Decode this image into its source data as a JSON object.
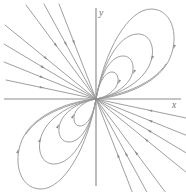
{
  "figure": {
    "kind": "phase-portrait",
    "title": "",
    "background_color": "#ffffff",
    "width": 186,
    "height": 192
  },
  "axes": {
    "origin": {
      "x": 96,
      "y": 99
    },
    "x_axis": {
      "x1": 4,
      "y1": 99,
      "x2": 181,
      "y2": 99
    },
    "y_axis": {
      "x1": 96,
      "y1": 8,
      "x2": 96,
      "y2": 186
    },
    "color": "#8c8c8c",
    "x_label": "x",
    "y_label": "y",
    "x_label_pos": {
      "x": 172,
      "y": 108
    },
    "y_label_pos": {
      "x": 99,
      "y": 16
    }
  },
  "chart_data": {
    "type": "line",
    "title": "",
    "xlabel": "x",
    "ylabel": "y",
    "grid": false,
    "legend": null,
    "curve_color": "#9a9a9a",
    "arrow_color": "#8f8f8f",
    "series": [
      {
        "name": "ray-q2-1",
        "kind": "ray",
        "quadrant": "II",
        "path": "M 6 80 L 96 99",
        "arrows": [
          {
            "x": 42,
            "y": 87.6,
            "angle": 11.9
          }
        ]
      },
      {
        "name": "ray-q2-2",
        "kind": "ray",
        "quadrant": "II",
        "path": "M 4 62 L 96 99",
        "arrows": [
          {
            "x": 42,
            "y": 77.3,
            "angle": 21.9
          }
        ]
      },
      {
        "name": "ray-q2-3",
        "kind": "ray",
        "quadrant": "II",
        "path": "M 4 44 L 96 99",
        "arrows": [
          {
            "x": 43,
            "y": 67.3,
            "angle": 30.9
          }
        ]
      },
      {
        "name": "ray-q2-4",
        "kind": "ray",
        "quadrant": "II",
        "path": "M 5 25 L 96 99",
        "arrows": [
          {
            "x": 46,
            "y": 58.3,
            "angle": 39.1
          }
        ]
      },
      {
        "name": "ray-q2-5",
        "kind": "ray",
        "quadrant": "II",
        "path": "M 26 5 L 96 99",
        "arrows": [
          {
            "x": 56,
            "y": 45.3,
            "angle": 53.3
          }
        ]
      },
      {
        "name": "ray-q2-6",
        "kind": "ray",
        "quadrant": "II",
        "path": "M 44 4 L 96 99",
        "arrows": [
          {
            "x": 66,
            "y": 44.2,
            "angle": 61.3
          }
        ]
      },
      {
        "name": "ray-q2-7",
        "kind": "ray",
        "quadrant": "II",
        "path": "M 59 4 L 96 99",
        "arrows": [
          {
            "x": 74,
            "y": 42.5,
            "angle": 68.7
          }
        ]
      },
      {
        "name": "ray-q4-1",
        "kind": "ray",
        "quadrant": "IV",
        "path": "M 186 118 L 96 99",
        "arrows": [
          {
            "x": 150,
            "y": 110.4,
            "angle": 191.9
          }
        ]
      },
      {
        "name": "ray-q4-2",
        "kind": "ray",
        "quadrant": "IV",
        "path": "M 188 136 L 96 99",
        "arrows": [
          {
            "x": 150,
            "y": 120.7,
            "angle": 201.9
          }
        ]
      },
      {
        "name": "ray-q4-3",
        "kind": "ray",
        "quadrant": "IV",
        "path": "M 188 154 L 96 99",
        "arrows": [
          {
            "x": 149,
            "y": 130.7,
            "angle": 210.9
          }
        ]
      },
      {
        "name": "ray-q4-4",
        "kind": "ray",
        "quadrant": "IV",
        "path": "M 187 173 L 96 99",
        "arrows": [
          {
            "x": 146,
            "y": 139.7,
            "angle": 219.1
          }
        ]
      },
      {
        "name": "ray-q4-5",
        "kind": "ray",
        "quadrant": "IV",
        "path": "M 166 193 L 96 99",
        "arrows": [
          {
            "x": 136,
            "y": 152.7,
            "angle": 233.3
          }
        ]
      },
      {
        "name": "ray-q4-6",
        "kind": "ray",
        "quadrant": "IV",
        "path": "M 148 194 L 96 99",
        "arrows": [
          {
            "x": 126,
            "y": 153.8,
            "angle": 241.3
          }
        ]
      },
      {
        "name": "ray-q4-7",
        "kind": "ray",
        "quadrant": "IV",
        "path": "M 133 194 L 96 99",
        "arrows": [
          {
            "x": 118,
            "y": 155.5,
            "angle": 248.7
          }
        ]
      },
      {
        "name": "loop-q1-outer",
        "kind": "loop",
        "quadrant": "I",
        "path": "M 96 99 C 104 52 128 8 152 9 C 174 10 180 40 168 62 C 156 84 122 97 96 99 Z",
        "arrows": [
          {
            "x": 174,
            "y": 47,
            "angle": 110
          }
        ]
      },
      {
        "name": "loop-q1-mid",
        "kind": "loop",
        "quadrant": "I",
        "path": "M 96 99 C 102 66 118 35 137 34 C 152 33 157 52 148 68 C 139 84 116 96 96 99 Z",
        "arrows": [
          {
            "x": 152,
            "y": 58,
            "angle": 116
          }
        ]
      },
      {
        "name": "loop-q1-inner",
        "kind": "loop",
        "quadrant": "I",
        "path": "M 96 99 C 100 76 110 56 123 56 C 133 56 136 68 130 79 C 124 89 110 97 96 99 Z",
        "arrows": [
          {
            "x": 134,
            "y": 72,
            "angle": 116
          }
        ]
      },
      {
        "name": "loop-q1-tiny",
        "kind": "loop",
        "quadrant": "I",
        "path": "M 96 99 C 98 85 104 72 112 72 C 118 72 120 80 116 87 C 112 93 104 98 96 99 Z",
        "arrows": [
          {
            "x": 119,
            "y": 82,
            "angle": 118
          }
        ]
      },
      {
        "name": "loop-q3-outer",
        "kind": "loop",
        "quadrant": "III",
        "path": "M 96 99 C 88 146 64 190 40 189 C 18 188 12 158 24 136 C 36 114 70 101 96 99 Z",
        "arrows": [
          {
            "x": 18,
            "y": 151,
            "angle": 290
          }
        ]
      },
      {
        "name": "loop-q3-mid",
        "kind": "loop",
        "quadrant": "III",
        "path": "M 96 99 C 90 132 74 163 55 164 C 40 165 35 146 44 130 C 53 114 76 102 96 99 Z",
        "arrows": [
          {
            "x": 40,
            "y": 140,
            "angle": 296
          }
        ]
      },
      {
        "name": "loop-q3-inner",
        "kind": "loop",
        "quadrant": "III",
        "path": "M 96 99 C 92 122 82 142 69 142 C 59 142 56 130 62 119 C 68 109 82 101 96 99 Z",
        "arrows": [
          {
            "x": 58,
            "y": 126,
            "angle": 296
          }
        ]
      },
      {
        "name": "loop-q3-tiny",
        "kind": "loop",
        "quadrant": "III",
        "path": "M 96 99 C 94 113 88 126 80 126 C 74 126 72 118 76 111 C 80 105 88 100 96 99 Z",
        "arrows": [
          {
            "x": 73,
            "y": 116,
            "angle": 298
          }
        ]
      },
      {
        "name": "loop-q1-enter-1",
        "kind": "separatrix",
        "quadrant": "I",
        "path": "M 96 99 C 116 96 152 86 166 64",
        "arrows": []
      },
      {
        "name": "loop-q3-enter-1",
        "kind": "separatrix",
        "quadrant": "III",
        "path": "M 96 99 C 76 102 40 112 26 134",
        "arrows": []
      }
    ]
  }
}
